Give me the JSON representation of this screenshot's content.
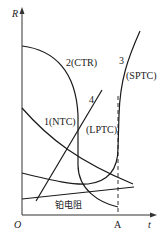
{
  "figure": {
    "type": "resistance-temperature characteristic curves",
    "axes": {
      "y_label": "R",
      "x_label": "t",
      "origin_label": "O",
      "x_mark_label": "A"
    },
    "curves": [
      {
        "id": "1",
        "label": "1(NTC)"
      },
      {
        "id": "2",
        "label": "2(CTR)"
      },
      {
        "id": "3",
        "label": "3",
        "sub_label": "(SPTC)"
      },
      {
        "id": "4",
        "label": "4",
        "sub_label": "(LPTC)"
      },
      {
        "id": "platinum",
        "label": "铂电阻"
      }
    ],
    "colors": {
      "line": "#1a1a1a",
      "background": "#ffffff"
    }
  }
}
